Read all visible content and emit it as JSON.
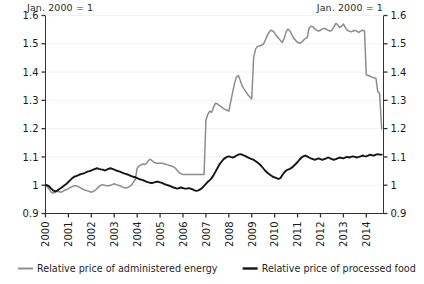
{
  "chart_data": {
    "type": "line",
    "title": "",
    "note_left": "Jan. 2000 = 1",
    "note_right": "Jan. 2000 = 1",
    "xlabel": "",
    "ylabel": "",
    "xlim": [
      2000.0,
      2014.75
    ],
    "ylim": [
      0.9,
      1.6
    ],
    "yticks": [
      "0.9",
      "1",
      "1.1",
      "1.2",
      "1.3",
      "1.4",
      "1.5",
      "1.6"
    ],
    "ytick_values": [
      0.9,
      1.0,
      1.1,
      1.2,
      1.3,
      1.4,
      1.5,
      1.6
    ],
    "xticks": [
      "2000",
      "2001",
      "2002",
      "2003",
      "2004",
      "2005",
      "2006",
      "2007",
      "2008",
      "2009",
      "2010",
      "2011",
      "2012",
      "2013",
      "2014"
    ],
    "xtick_values": [
      2000,
      2001,
      2002,
      2003,
      2004,
      2005,
      2006,
      2007,
      2008,
      2009,
      2010,
      2011,
      2012,
      2013,
      2014
    ],
    "grid": true,
    "grid_axis": "y",
    "grid_color": "#f2f2f2",
    "dual_axis": true,
    "legend_position": "bottom",
    "series": [
      {
        "name": "Relative price of administered energy",
        "color": "#8c8c8c",
        "x": [
          2000.0,
          2000.08,
          2000.17,
          2000.25,
          2000.33,
          2000.42,
          2000.5,
          2000.58,
          2000.67,
          2000.75,
          2000.83,
          2000.92,
          2001.0,
          2001.08,
          2001.17,
          2001.25,
          2001.33,
          2001.42,
          2001.5,
          2001.58,
          2001.67,
          2001.75,
          2001.83,
          2001.92,
          2002.0,
          2002.08,
          2002.17,
          2002.25,
          2002.33,
          2002.42,
          2002.5,
          2002.58,
          2002.67,
          2002.75,
          2002.83,
          2002.92,
          2003.0,
          2003.08,
          2003.17,
          2003.25,
          2003.33,
          2003.42,
          2003.5,
          2003.58,
          2003.67,
          2003.75,
          2003.83,
          2003.92,
          2004.0,
          2004.08,
          2004.17,
          2004.25,
          2004.33,
          2004.42,
          2004.5,
          2004.58,
          2004.67,
          2004.75,
          2004.83,
          2004.92,
          2005.0,
          2005.08,
          2005.17,
          2005.25,
          2005.33,
          2005.42,
          2005.5,
          2005.58,
          2005.67,
          2005.75,
          2005.83,
          2005.92,
          2006.0,
          2006.08,
          2006.17,
          2006.25,
          2006.33,
          2006.42,
          2006.5,
          2006.58,
          2006.67,
          2006.75,
          2006.83,
          2006.92,
          2007.0,
          2007.08,
          2007.17,
          2007.25,
          2007.33,
          2007.42,
          2007.5,
          2007.58,
          2007.67,
          2007.75,
          2007.83,
          2007.92,
          2008.0,
          2008.08,
          2008.17,
          2008.25,
          2008.33,
          2008.42,
          2008.5,
          2008.58,
          2008.67,
          2008.75,
          2008.83,
          2008.92,
          2009.0,
          2009.08,
          2009.17,
          2009.25,
          2009.33,
          2009.42,
          2009.5,
          2009.58,
          2009.67,
          2009.75,
          2009.83,
          2009.92,
          2010.0,
          2010.08,
          2010.17,
          2010.25,
          2010.33,
          2010.42,
          2010.5,
          2010.58,
          2010.67,
          2010.75,
          2010.83,
          2010.92,
          2011.0,
          2011.08,
          2011.17,
          2011.25,
          2011.33,
          2011.42,
          2011.5,
          2011.58,
          2011.67,
          2011.75,
          2011.83,
          2011.92,
          2012.0,
          2012.08,
          2012.17,
          2012.25,
          2012.33,
          2012.42,
          2012.5,
          2012.58,
          2012.67,
          2012.75,
          2012.83,
          2012.92,
          2013.0,
          2013.08,
          2013.17,
          2013.25,
          2013.33,
          2013.42,
          2013.5,
          2013.58,
          2013.67,
          2013.75,
          2013.83,
          2013.92,
          2014.0,
          2014.08,
          2014.17,
          2014.25,
          2014.33,
          2014.42,
          2014.5,
          2014.58,
          2014.67
        ],
        "values": [
          1.0,
          0.995,
          0.985,
          0.975,
          0.972,
          0.975,
          0.978,
          0.978,
          0.975,
          0.978,
          0.982,
          0.985,
          0.988,
          0.992,
          0.995,
          0.998,
          0.998,
          0.995,
          0.992,
          0.988,
          0.985,
          0.982,
          0.98,
          0.978,
          0.975,
          0.978,
          0.982,
          0.988,
          0.995,
          1.0,
          1.002,
          1.0,
          0.998,
          0.998,
          1.0,
          1.002,
          1.005,
          1.002,
          1.0,
          0.998,
          0.995,
          0.992,
          0.99,
          0.992,
          0.995,
          1.0,
          1.01,
          1.02,
          1.06,
          1.068,
          1.072,
          1.075,
          1.073,
          1.078,
          1.088,
          1.092,
          1.085,
          1.08,
          1.078,
          1.078,
          1.078,
          1.078,
          1.076,
          1.074,
          1.072,
          1.07,
          1.068,
          1.065,
          1.06,
          1.052,
          1.045,
          1.04,
          1.038,
          1.038,
          1.038,
          1.038,
          1.038,
          1.038,
          1.038,
          1.038,
          1.038,
          1.038,
          1.038,
          1.038,
          1.23,
          1.25,
          1.262,
          1.258,
          1.275,
          1.29,
          1.288,
          1.282,
          1.278,
          1.272,
          1.268,
          1.265,
          1.262,
          1.295,
          1.33,
          1.36,
          1.382,
          1.388,
          1.37,
          1.352,
          1.34,
          1.33,
          1.32,
          1.312,
          1.305,
          1.45,
          1.482,
          1.49,
          1.492,
          1.495,
          1.498,
          1.51,
          1.528,
          1.54,
          1.548,
          1.545,
          1.538,
          1.528,
          1.52,
          1.512,
          1.505,
          1.52,
          1.542,
          1.552,
          1.545,
          1.532,
          1.52,
          1.512,
          1.505,
          1.502,
          1.505,
          1.512,
          1.518,
          1.522,
          1.555,
          1.562,
          1.56,
          1.552,
          1.548,
          1.545,
          1.548,
          1.552,
          1.555,
          1.552,
          1.548,
          1.545,
          1.548,
          1.558,
          1.572,
          1.568,
          1.558,
          1.562,
          1.57,
          1.558,
          1.548,
          1.545,
          1.542,
          1.545,
          1.548,
          1.545,
          1.54,
          1.545,
          1.548,
          1.545,
          1.39,
          1.388,
          1.385,
          1.382,
          1.38,
          1.378,
          1.33,
          1.325,
          1.2
        ]
      },
      {
        "name": "Relative price of processed food",
        "color": "#141414",
        "x": [
          2000.0,
          2000.08,
          2000.17,
          2000.25,
          2000.33,
          2000.42,
          2000.5,
          2000.58,
          2000.67,
          2000.75,
          2000.83,
          2000.92,
          2001.0,
          2001.08,
          2001.17,
          2001.25,
          2001.33,
          2001.42,
          2001.5,
          2001.58,
          2001.67,
          2001.75,
          2001.83,
          2001.92,
          2002.0,
          2002.08,
          2002.17,
          2002.25,
          2002.33,
          2002.42,
          2002.5,
          2002.58,
          2002.67,
          2002.75,
          2002.83,
          2002.92,
          2003.0,
          2003.08,
          2003.17,
          2003.25,
          2003.33,
          2003.42,
          2003.5,
          2003.58,
          2003.67,
          2003.75,
          2003.83,
          2003.92,
          2004.0,
          2004.08,
          2004.17,
          2004.25,
          2004.33,
          2004.42,
          2004.5,
          2004.58,
          2004.67,
          2004.75,
          2004.83,
          2004.92,
          2005.0,
          2005.08,
          2005.17,
          2005.25,
          2005.33,
          2005.42,
          2005.5,
          2005.58,
          2005.67,
          2005.75,
          2005.83,
          2005.92,
          2006.0,
          2006.08,
          2006.17,
          2006.25,
          2006.33,
          2006.42,
          2006.5,
          2006.58,
          2006.67,
          2006.75,
          2006.83,
          2006.92,
          2007.0,
          2007.08,
          2007.17,
          2007.25,
          2007.33,
          2007.42,
          2007.5,
          2007.58,
          2007.67,
          2007.75,
          2007.83,
          2007.92,
          2008.0,
          2008.08,
          2008.17,
          2008.25,
          2008.33,
          2008.42,
          2008.5,
          2008.58,
          2008.67,
          2008.75,
          2008.83,
          2008.92,
          2009.0,
          2009.08,
          2009.17,
          2009.25,
          2009.33,
          2009.42,
          2009.5,
          2009.58,
          2009.67,
          2009.75,
          2009.83,
          2009.92,
          2010.0,
          2010.08,
          2010.17,
          2010.25,
          2010.33,
          2010.42,
          2010.5,
          2010.58,
          2010.67,
          2010.75,
          2010.83,
          2010.92,
          2011.0,
          2011.08,
          2011.17,
          2011.25,
          2011.33,
          2011.42,
          2011.5,
          2011.58,
          2011.67,
          2011.75,
          2011.83,
          2011.92,
          2012.0,
          2012.08,
          2012.17,
          2012.25,
          2012.33,
          2012.42,
          2012.5,
          2012.58,
          2012.67,
          2012.75,
          2012.83,
          2012.92,
          2013.0,
          2013.08,
          2013.17,
          2013.25,
          2013.33,
          2013.42,
          2013.5,
          2013.58,
          2013.67,
          2013.75,
          2013.83,
          2013.92,
          2014.0,
          2014.08,
          2014.17,
          2014.25,
          2014.33,
          2014.42,
          2014.5,
          2014.58,
          2014.67
        ],
        "values": [
          1.0,
          1.0,
          0.995,
          0.988,
          0.982,
          0.978,
          0.98,
          0.985,
          0.99,
          0.995,
          1.0,
          1.005,
          1.012,
          1.018,
          1.025,
          1.03,
          1.032,
          1.035,
          1.038,
          1.04,
          1.042,
          1.045,
          1.048,
          1.05,
          1.052,
          1.055,
          1.058,
          1.06,
          1.058,
          1.056,
          1.055,
          1.052,
          1.055,
          1.058,
          1.06,
          1.058,
          1.055,
          1.052,
          1.05,
          1.048,
          1.045,
          1.042,
          1.04,
          1.038,
          1.035,
          1.032,
          1.03,
          1.028,
          1.025,
          1.022,
          1.02,
          1.018,
          1.015,
          1.012,
          1.01,
          1.008,
          1.008,
          1.01,
          1.012,
          1.012,
          1.01,
          1.008,
          1.005,
          1.002,
          1.0,
          0.998,
          0.995,
          0.992,
          0.99,
          0.988,
          0.99,
          0.992,
          0.99,
          0.988,
          0.988,
          0.99,
          0.988,
          0.985,
          0.982,
          0.98,
          0.982,
          0.985,
          0.99,
          0.998,
          1.005,
          1.012,
          1.018,
          1.025,
          1.035,
          1.048,
          1.06,
          1.072,
          1.082,
          1.09,
          1.096,
          1.1,
          1.102,
          1.1,
          1.098,
          1.1,
          1.105,
          1.108,
          1.11,
          1.108,
          1.105,
          1.102,
          1.098,
          1.095,
          1.092,
          1.09,
          1.085,
          1.08,
          1.075,
          1.068,
          1.06,
          1.052,
          1.045,
          1.04,
          1.035,
          1.03,
          1.028,
          1.025,
          1.022,
          1.025,
          1.035,
          1.045,
          1.052,
          1.055,
          1.058,
          1.062,
          1.068,
          1.075,
          1.082,
          1.09,
          1.098,
          1.102,
          1.105,
          1.102,
          1.098,
          1.095,
          1.092,
          1.09,
          1.092,
          1.095,
          1.092,
          1.09,
          1.092,
          1.095,
          1.098,
          1.095,
          1.092,
          1.09,
          1.092,
          1.095,
          1.098,
          1.096,
          1.095,
          1.098,
          1.1,
          1.098,
          1.1,
          1.102,
          1.1,
          1.098,
          1.1,
          1.102,
          1.105,
          1.103,
          1.102,
          1.105,
          1.108,
          1.106,
          1.105,
          1.108,
          1.11,
          1.108,
          1.108
        ]
      }
    ]
  },
  "legend": [
    {
      "label": "Relative price of administered energy",
      "color": "#8c8c8c"
    },
    {
      "label": "Relative price of processed food",
      "color": "#141414"
    }
  ]
}
